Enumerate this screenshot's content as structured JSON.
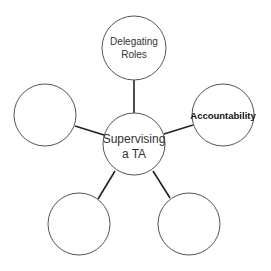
{
  "diagram": {
    "type": "mind-map",
    "center": {
      "lines": [
        "Supervising",
        "a TA"
      ],
      "cx": 134,
      "cy": 144,
      "r": 31
    },
    "nodes": [
      {
        "id": "top",
        "lines": [
          "Delegating",
          "Roles"
        ],
        "cx": 134,
        "cy": 48,
        "r": 32,
        "bold": false
      },
      {
        "id": "right",
        "lines": [
          "Accountability"
        ],
        "cx": 223,
        "cy": 115,
        "r": 31,
        "bold": true
      },
      {
        "id": "bottom-right",
        "lines": [],
        "cx": 189,
        "cy": 224,
        "r": 31,
        "bold": false
      },
      {
        "id": "bottom-left",
        "lines": [],
        "cx": 79,
        "cy": 224,
        "r": 31,
        "bold": false
      },
      {
        "id": "left",
        "lines": [],
        "cx": 45,
        "cy": 115,
        "r": 31,
        "bold": false
      }
    ],
    "edges": [
      {
        "to": "top",
        "x1": 134,
        "y1": 113,
        "x2": 134,
        "y2": 80
      },
      {
        "to": "right",
        "x1": 164,
        "y1": 134,
        "x2": 193,
        "y2": 125
      },
      {
        "to": "bottom-right",
        "x1": 153,
        "y1": 171,
        "x2": 170,
        "y2": 198
      },
      {
        "to": "bottom-left",
        "x1": 115,
        "y1": 171,
        "x2": 98,
        "y2": 199
      },
      {
        "to": "left",
        "x1": 75,
        "y1": 126,
        "x2": 104,
        "y2": 135
      }
    ]
  },
  "labels": {
    "center_line1": "Supervising",
    "center_line2": "a TA",
    "top_line1": "Delegating",
    "top_line2": "Roles",
    "right_line1": "Accountability"
  },
  "colors": {
    "circle_stroke": "#555555",
    "connector": "#222222",
    "text": "#333333",
    "background": "#ffffff"
  }
}
